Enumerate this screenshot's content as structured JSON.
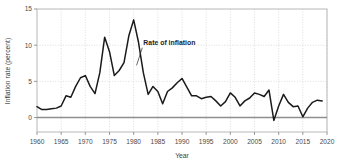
{
  "chart_data": {
    "type": "line",
    "title": "",
    "xlabel": "Year",
    "ylabel": "Inflation rate (percent)",
    "xlim": [
      1960,
      2020
    ],
    "ylim": [
      -2,
      15
    ],
    "xticks": [
      1960,
      1965,
      1970,
      1975,
      1980,
      1985,
      1990,
      1995,
      2000,
      2005,
      2010,
      2015,
      2020
    ],
    "yticks": [
      0,
      5,
      10,
      15
    ],
    "grid": "dotted vertical gridlines at each x tick; dotted horizontal gridlines at 5 and 10",
    "legend": "none",
    "zero_line": 0,
    "series": [
      {
        "name": "Rate of inflation",
        "color": "#1a1a1a",
        "x": [
          1960,
          1961,
          1962,
          1963,
          1964,
          1965,
          1966,
          1967,
          1968,
          1969,
          1970,
          1971,
          1972,
          1973,
          1974,
          1975,
          1976,
          1977,
          1978,
          1979,
          1980,
          1981,
          1982,
          1983,
          1984,
          1985,
          1986,
          1987,
          1988,
          1989,
          1990,
          1991,
          1992,
          1993,
          1994,
          1995,
          1996,
          1997,
          1998,
          1999,
          2000,
          2001,
          2002,
          2003,
          2004,
          2005,
          2006,
          2007,
          2008,
          2009,
          2010,
          2011,
          2012,
          2013,
          2014,
          2015,
          2016,
          2017,
          2018,
          2019
        ],
        "values": [
          1.5,
          1.1,
          1.1,
          1.2,
          1.3,
          1.6,
          3.0,
          2.8,
          4.3,
          5.5,
          5.8,
          4.3,
          3.3,
          6.2,
          11.1,
          9.1,
          5.8,
          6.5,
          7.6,
          11.3,
          13.5,
          10.4,
          6.2,
          3.2,
          4.3,
          3.6,
          1.9,
          3.6,
          4.1,
          4.8,
          5.4,
          4.2,
          3.0,
          3.0,
          2.6,
          2.8,
          2.9,
          2.3,
          1.6,
          2.2,
          3.4,
          2.8,
          1.6,
          2.3,
          2.7,
          3.4,
          3.2,
          2.9,
          3.8,
          -0.4,
          1.6,
          3.2,
          2.1,
          1.5,
          1.6,
          0.1,
          1.3,
          2.1,
          2.4,
          2.3
        ]
      }
    ],
    "annotations": [
      {
        "text": "Rate of inflation",
        "x": 1982,
        "y": 10.0,
        "points_to_x": 1980.6,
        "points_to_y": 7.2
      }
    ]
  },
  "axis": {
    "x_title": "Year",
    "y_title": "Inflation rate (percent)",
    "x_tick_labels": [
      "1960",
      "1965",
      "1970",
      "1975",
      "1980",
      "1985",
      "1990",
      "1995",
      "2000",
      "2005",
      "2010",
      "2015",
      "2020"
    ],
    "y_tick_labels": [
      "0",
      "5",
      "10",
      "15"
    ]
  },
  "annotation": {
    "label": "Rate of inflation"
  },
  "style": {
    "line_color": "#1a1a1a",
    "frame_color": "#b8b8b8",
    "grid_color": "#cfcfcf",
    "zero_line_color": "#8f8f8f",
    "background": "#ffffff"
  }
}
